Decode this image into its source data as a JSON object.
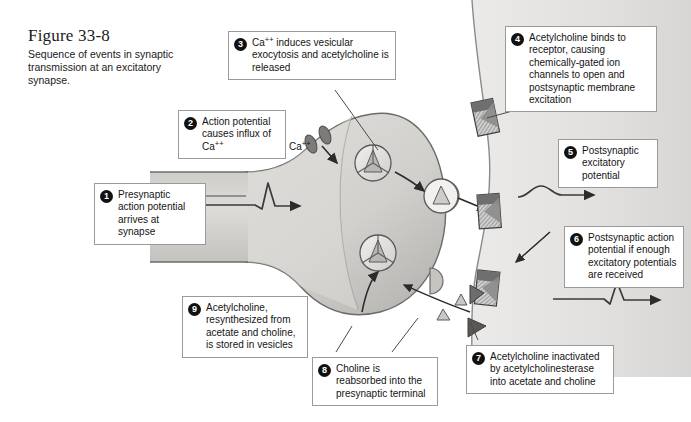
{
  "figure": {
    "number": "Figure 33-8",
    "caption": "Sequence of events in synaptic transmission at an excitatory synapse."
  },
  "labels": {
    "calcium": "Ca",
    "calcium_charge": "++"
  },
  "steps": [
    {
      "n": "1",
      "text": "Presynaptic action potential arrives at synapse"
    },
    {
      "n": "2",
      "text": "Action potential causes influx of Ca++"
    },
    {
      "n": "3",
      "text": "Ca++ induces vesicular exocytosis and acetylcholine is released"
    },
    {
      "n": "4",
      "text": "Acetylcholine binds to receptor, causing chemically-gated ion channels to open and postsynaptic membrane excitation"
    },
    {
      "n": "5",
      "text": "Postsynaptic excitatory potential"
    },
    {
      "n": "6",
      "text": "Postsynaptic action potential if enough excitatory potentials are received"
    },
    {
      "n": "7",
      "text": "Acetylcholine inactivated by acetylcholinesterase into acetate and choline"
    },
    {
      "n": "8",
      "text": "Choline is reabsorbed into the presynaptic terminal"
    },
    {
      "n": "9",
      "text": "Acetylcholine, resynthesized from acetate and choline, is stored in vesicles"
    }
  ],
  "colors": {
    "terminal_fill": "#d8d6d3",
    "terminal_fill_dark": "#b9b7b4",
    "postsynaptic_fill": "#e3e2e1",
    "outline": "#4a4a4a",
    "receptor_dark": "#6f6f6f",
    "receptor_light": "#c9c9c9",
    "callout_border": "#9a9a9a",
    "number_badge": "#111111",
    "text": "#141414"
  },
  "diagram": {
    "type": "synaptic-transmission-schematic",
    "presynaptic_terminal": "funnel-shaped axon terminal widening to the right",
    "postsynaptic_cell": "light grey region on the right side of the synaptic cleft",
    "vesicle_count": 3,
    "receptor_count": 3,
    "calcium_channel_count": 2,
    "waveforms": [
      {
        "name": "presynaptic-action-potential",
        "shape": "spike"
      },
      {
        "name": "postsynaptic-excitatory-potential",
        "shape": "bump"
      },
      {
        "name": "postsynaptic-action-potential",
        "shape": "spike"
      }
    ]
  }
}
